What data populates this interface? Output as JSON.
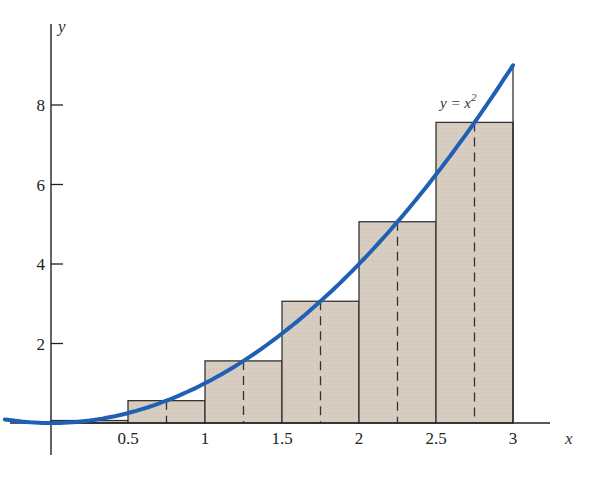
{
  "chart_data": {
    "type": "bar",
    "title": "",
    "xlabel": "x",
    "ylabel": "y",
    "xlim": [
      -0.3,
      3.4
    ],
    "ylim": [
      -1,
      9.3
    ],
    "grid": false,
    "x_ticks": [
      {
        "value": 0.5,
        "label": "0.5"
      },
      {
        "value": 1,
        "label": "1"
      },
      {
        "value": 1.5,
        "label": "1.5"
      },
      {
        "value": 2,
        "label": "2"
      },
      {
        "value": 2.5,
        "label": "2.5"
      },
      {
        "value": 3,
        "label": "3"
      }
    ],
    "y_ticks": [
      {
        "value": 2,
        "label": "2"
      },
      {
        "value": 4,
        "label": "4"
      },
      {
        "value": 6,
        "label": "6"
      },
      {
        "value": 8,
        "label": "8"
      }
    ],
    "rectangles": [
      {
        "x0": 0,
        "x1": 0.5,
        "midpoint": 0.25,
        "height": 0.0625
      },
      {
        "x0": 0.5,
        "x1": 1,
        "midpoint": 0.75,
        "height": 0.5625
      },
      {
        "x0": 1,
        "x1": 1.5,
        "midpoint": 1.25,
        "height": 1.5625
      },
      {
        "x0": 1.5,
        "x1": 2,
        "midpoint": 1.75,
        "height": 3.0625
      },
      {
        "x0": 2,
        "x1": 2.5,
        "midpoint": 2.25,
        "height": 5.0625
      },
      {
        "x0": 2.5,
        "x1": 3,
        "midpoint": 2.75,
        "height": 7.5625
      }
    ],
    "series": [
      {
        "name": "y = x^2",
        "type": "line",
        "function": "x^2",
        "x_range": [
          -0.3,
          3
        ],
        "color": "#1f5fb4"
      }
    ],
    "annotations": [
      {
        "text": "y = x²",
        "x": 2.55,
        "y": 8.1
      }
    ]
  },
  "labels": {
    "x_axis": "x",
    "y_axis": "y",
    "curve_label_main": "y = x",
    "curve_label_sup": "2"
  },
  "colors": {
    "rect_fill": "#d6ccc0",
    "rect_stroke": "#333333",
    "curve": "#1f5fb4",
    "axis": "#222222"
  }
}
